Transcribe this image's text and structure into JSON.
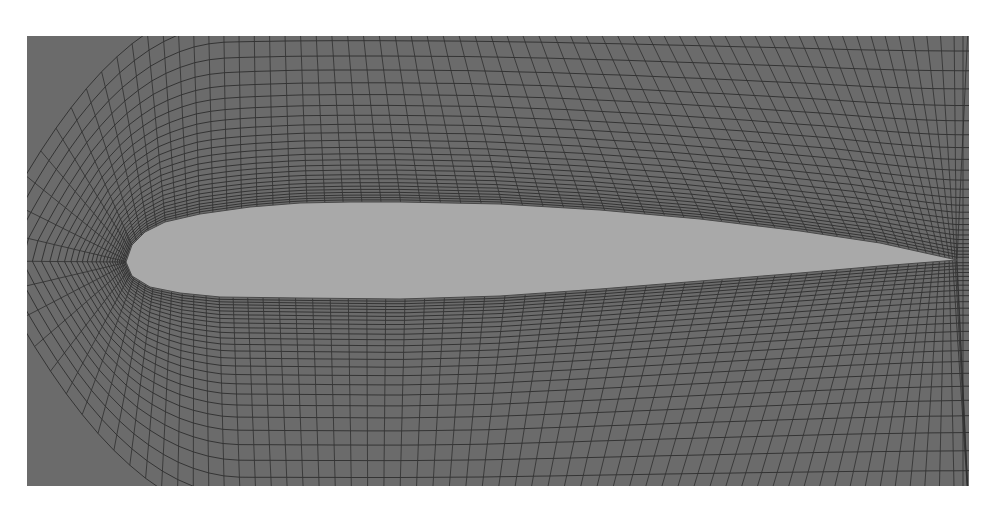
{
  "figure": {
    "colors": {
      "page_background": "#ffffff",
      "mesh_background": "#6b6b6b",
      "grid_line": "#2e2e2e",
      "airfoil_fill": "#a9a9a9"
    },
    "domain_box": {
      "x0": 27,
      "y0": 36,
      "x1": 969,
      "y1": 486
    },
    "airfoil": {
      "leading_edge": {
        "x": 126,
        "y": 262
      },
      "trailing_edge": {
        "x": 957,
        "y": 260
      },
      "max_thickness_px": 97,
      "upper_surface": [
        [
          126,
          262
        ],
        [
          132,
          245
        ],
        [
          145,
          232
        ],
        [
          165,
          222
        ],
        [
          200,
          214
        ],
        [
          250,
          207
        ],
        [
          300,
          203
        ],
        [
          350,
          202
        ],
        [
          400,
          202
        ],
        [
          500,
          204
        ],
        [
          600,
          210
        ],
        [
          700,
          219
        ],
        [
          800,
          231
        ],
        [
          880,
          243
        ],
        [
          957,
          260
        ]
      ],
      "lower_surface": [
        [
          126,
          262
        ],
        [
          132,
          276
        ],
        [
          150,
          287
        ],
        [
          180,
          293
        ],
        [
          220,
          297
        ],
        [
          300,
          298
        ],
        [
          400,
          299
        ],
        [
          500,
          296
        ],
        [
          600,
          289
        ],
        [
          700,
          281
        ],
        [
          800,
          273
        ],
        [
          880,
          266
        ],
        [
          957,
          260
        ]
      ]
    },
    "mesh": {
      "ring_count": 26,
      "radial_count": 130,
      "ring_growth": 1.09
    }
  }
}
